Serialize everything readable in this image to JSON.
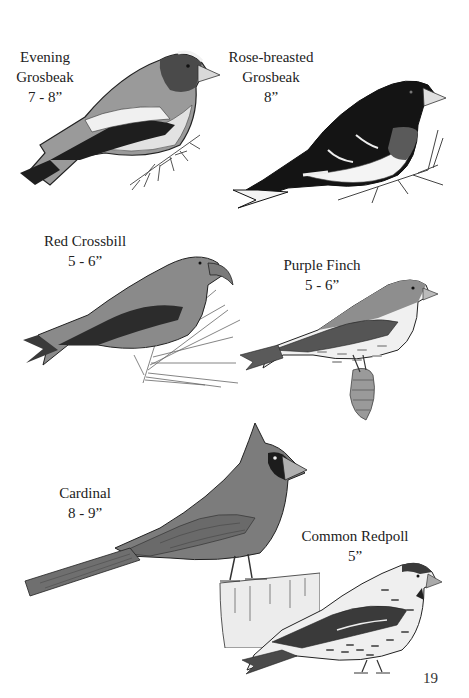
{
  "page": {
    "page_number": "19",
    "background": "#ffffff"
  },
  "birds": [
    {
      "name_line1": "Evening",
      "name_line2": "Grosbeak",
      "size": "7 - 8”",
      "illustration": "evening-grosbeak-illustration"
    },
    {
      "name_line1": "Rose-breasted",
      "name_line2": "Grosbeak",
      "size": "8”",
      "illustration": "rose-breasted-grosbeak-illustration"
    },
    {
      "name_line1": "Red Crossbill",
      "size": "5 - 6”",
      "illustration": "red-crossbill-illustration"
    },
    {
      "name_line1": "Purple Finch",
      "size": "5 - 6”",
      "illustration": "purple-finch-illustration"
    },
    {
      "name_line1": "Cardinal",
      "size": "8 - 9”",
      "illustration": "cardinal-illustration"
    },
    {
      "name_line1": "Common Redpoll",
      "size": "5”",
      "illustration": "common-redpoll-illustration"
    }
  ],
  "colors": {
    "ink": "#222222",
    "dark": "#1c1c1c",
    "mid": "#6e6e6e",
    "light": "#b8b8b8",
    "pale": "#e6e6e6"
  }
}
